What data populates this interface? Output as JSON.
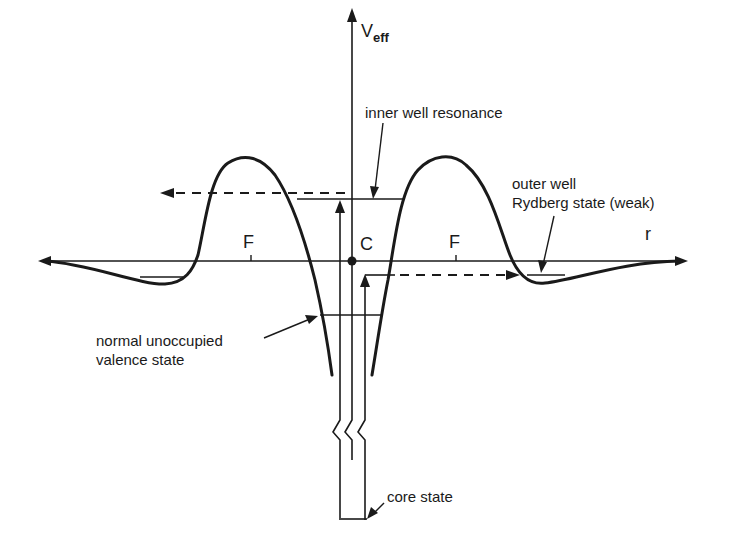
{
  "figure": {
    "type": "schematic"
  },
  "axes": {
    "y_label_main": "V",
    "y_label_sub": "eff",
    "x_label": "r"
  },
  "points": {
    "center_label": "C",
    "left_tick_label": "F",
    "right_tick_label": "F"
  },
  "annotations": {
    "inner_well": "inner well resonance",
    "outer_well_line1": "outer well",
    "outer_well_line2": "Rydberg state (weak)",
    "valence_line1": "normal unoccupied",
    "valence_line2": "valence state",
    "core": "core state"
  },
  "colors": {
    "ink": "#1a1a1a",
    "background": "#ffffff"
  }
}
